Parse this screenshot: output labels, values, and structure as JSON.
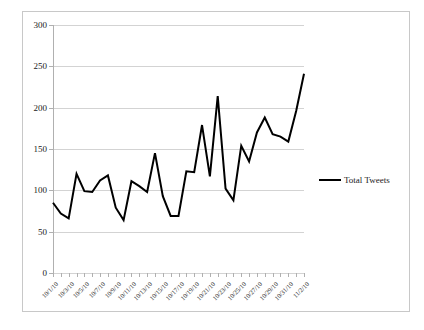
{
  "chart_data": {
    "type": "line",
    "title": "",
    "xlabel": "",
    "ylabel": "",
    "ylim": [
      0,
      300
    ],
    "yticks": [
      0,
      50,
      100,
      150,
      200,
      250,
      300
    ],
    "grid": true,
    "legend_position": "right",
    "legend": [
      "Total Tweets"
    ],
    "categories": [
      "10/1/10",
      "10/2/10",
      "10/3/10",
      "10/4/10",
      "10/5/10",
      "10/6/10",
      "10/7/10",
      "10/8/10",
      "10/9/10",
      "10/10/10",
      "10/11/10",
      "10/12/10",
      "10/13/10",
      "10/14/10",
      "10/15/10",
      "10/16/10",
      "10/17/10",
      "10/18/10",
      "10/19/10",
      "10/20/10",
      "10/21/10",
      "10/22/10",
      "10/23/10",
      "10/24/10",
      "10/25/10",
      "10/26/10",
      "10/27/10",
      "10/28/10",
      "10/29/10",
      "10/30/10",
      "10/31/10",
      "11/1/10",
      "11/2/10"
    ],
    "tick_labels": [
      "10/1/10",
      "10/3/10",
      "10/5/10",
      "10/7/10",
      "10/9/10",
      "10/11/10",
      "10/13/10",
      "10/15/10",
      "10/17/10",
      "10/19/10",
      "10/21/10",
      "10/23/10",
      "10/25/10",
      "10/27/10",
      "10/29/10",
      "10/31/10",
      "11/2/10"
    ],
    "tick_label_indices": [
      0,
      2,
      4,
      6,
      8,
      10,
      12,
      14,
      16,
      18,
      20,
      22,
      24,
      26,
      28,
      30,
      32
    ],
    "series": [
      {
        "name": "Total Tweets",
        "color": "#000000",
        "values": [
          85,
          72,
          66,
          120,
          99,
          98,
          112,
          118,
          79,
          64,
          111,
          105,
          98,
          145,
          93,
          69,
          69,
          123,
          122,
          179,
          117,
          214,
          102,
          88,
          154,
          135,
          170,
          188,
          168,
          165,
          159,
          196,
          241
        ]
      }
    ]
  },
  "legend": {
    "series_label": "Total Tweets"
  },
  "axis": {
    "y_labels": [
      "0",
      "50",
      "100",
      "150",
      "200",
      "250",
      "300"
    ]
  },
  "colors": {
    "series": "#000000",
    "gridline": "#d3d3d3",
    "axis": "#b0b0b0",
    "frame": "#c8c8c8",
    "background": "#ffffff",
    "text": "#1a1a1a"
  }
}
